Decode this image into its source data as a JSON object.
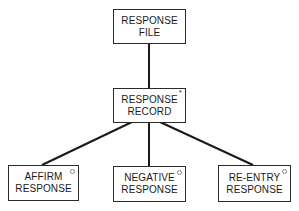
{
  "diagram": {
    "type": "hierarchy",
    "nodes": [
      {
        "id": "file",
        "line1": "RESPONSE",
        "line2": "FILE",
        "marker": ""
      },
      {
        "id": "record",
        "line1": "RESPONSE",
        "line2": "RECORD",
        "marker": "*"
      },
      {
        "id": "affirm",
        "line1": "AFFIRM",
        "line2": "RESPONSE",
        "marker": "o"
      },
      {
        "id": "negative",
        "line1": "NEGATIVE",
        "line2": "RESPONSE",
        "marker": "o"
      },
      {
        "id": "reentry",
        "line1": "RE-ENTRY",
        "line2": "RESPONSE",
        "marker": "o"
      }
    ],
    "edges": [
      {
        "from": "file",
        "to": "record"
      },
      {
        "from": "record",
        "to": "affirm"
      },
      {
        "from": "record",
        "to": "negative"
      },
      {
        "from": "record",
        "to": "reentry"
      }
    ],
    "markers": {
      "iteration": "*",
      "selection": "o"
    }
  }
}
